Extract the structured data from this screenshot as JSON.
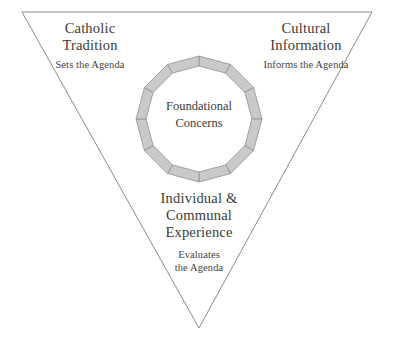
{
  "diagram": {
    "type": "inverted-triangle-with-segmented-ring",
    "background_color": "#ffffff",
    "triangle": {
      "stroke_color": "#8a8a8a",
      "fill": "none",
      "vertices": [
        [
          22,
          12
        ],
        [
          372,
          12
        ],
        [
          199,
          328
        ]
      ]
    },
    "ring": {
      "segment_count": 12,
      "fill_color": "#c9c9c9",
      "stroke_color": "#8f8f8f",
      "center": [
        199,
        119
      ],
      "outer_radius": 63,
      "inner_radius": 53
    },
    "center_label": "Foundational\nConcerns",
    "corners": [
      {
        "id": "catholic-tradition",
        "title": "Catholic\nTradition",
        "subtitle": "Sets the Agenda"
      },
      {
        "id": "cultural-information",
        "title": "Cultural\nInformation",
        "subtitle": "Informs the Agenda"
      },
      {
        "id": "individual-communal-experience",
        "title": "Individual &\nCommunal\nExperience",
        "subtitle": "Evaluates\nthe Agenda"
      }
    ]
  }
}
